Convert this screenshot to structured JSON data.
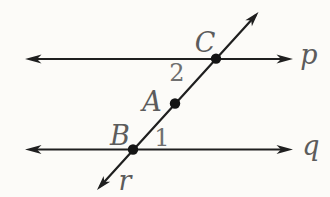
{
  "figure": {
    "type": "geometry-diagram-parallel-lines-with-transversal",
    "lines": {
      "p": {
        "label": "p"
      },
      "q": {
        "label": "q"
      },
      "r": {
        "label": "r"
      }
    },
    "points": {
      "C": {
        "label": "C",
        "on": "intersection of r and p"
      },
      "A": {
        "label": "A",
        "on": "r between p and q"
      },
      "B": {
        "label": "B",
        "on": "intersection of r and q"
      }
    },
    "angles": {
      "angle2": {
        "label": "2",
        "vertex": "C"
      },
      "angle1": {
        "label": "1",
        "vertex": "B"
      }
    },
    "colors": {
      "line": "#1f1f1f",
      "point": "#141414",
      "letter_label": "#5c5c5c",
      "number_label": "#6f6f6f",
      "background": "#fcfbf8"
    }
  }
}
